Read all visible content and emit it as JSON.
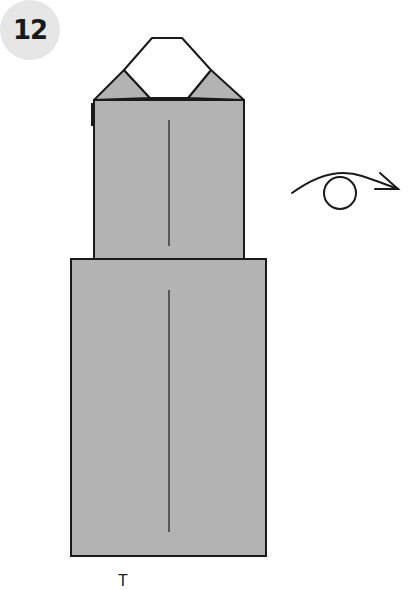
{
  "step": {
    "number": "12"
  },
  "diagram": {
    "fill_color": "#b3b3b3",
    "stroke_color": "#1a1a1a",
    "flap_color": "#ffffff",
    "action_symbol": "turn-over-arrow-icon"
  },
  "caption": {
    "text": "T"
  }
}
